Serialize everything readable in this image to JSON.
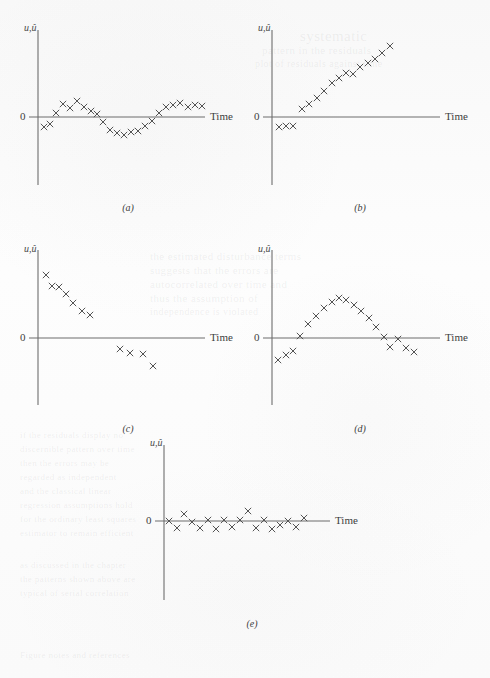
{
  "figure": {
    "background_color": "#fbfbfb",
    "axis_color": "#6d6d6d",
    "marker_color": "#545454",
    "marker_glyph": "x",
    "y_axis_label": "u,û",
    "x_axis_label": "Time",
    "zero_label": "0"
  },
  "ghost_text": [
    {
      "text": "systematic",
      "x": 300,
      "y": 28,
      "size": 15
    },
    {
      "text": "pattern in the residuals",
      "x": 262,
      "y": 44,
      "size": 11
    },
    {
      "text": "plot of residuals against time",
      "x": 255,
      "y": 58,
      "size": 10
    },
    {
      "text": "the estimated disturbance terms",
      "x": 150,
      "y": 250,
      "size": 11
    },
    {
      "text": "suggests that the errors are",
      "x": 150,
      "y": 264,
      "size": 11
    },
    {
      "text": "autocorrelated over time and",
      "x": 150,
      "y": 278,
      "size": 11
    },
    {
      "text": "thus the assumption of",
      "x": 150,
      "y": 292,
      "size": 11
    },
    {
      "text": "independence is violated",
      "x": 150,
      "y": 306,
      "size": 10
    },
    {
      "text": "if the residuals display no",
      "x": 20,
      "y": 430,
      "size": 9
    },
    {
      "text": "discernible pattern over time",
      "x": 20,
      "y": 444,
      "size": 9
    },
    {
      "text": "then the errors may be",
      "x": 20,
      "y": 458,
      "size": 9
    },
    {
      "text": "regarded as independent",
      "x": 20,
      "y": 472,
      "size": 9
    },
    {
      "text": "and the classical linear",
      "x": 20,
      "y": 486,
      "size": 9
    },
    {
      "text": "regression assumptions hold",
      "x": 20,
      "y": 500,
      "size": 9
    },
    {
      "text": "for the ordinary least squares",
      "x": 20,
      "y": 514,
      "size": 9
    },
    {
      "text": "estimator to remain efficient",
      "x": 20,
      "y": 528,
      "size": 9
    },
    {
      "text": "as discussed in the chapter",
      "x": 20,
      "y": 560,
      "size": 9
    },
    {
      "text": "the patterns shown above are",
      "x": 20,
      "y": 574,
      "size": 9
    },
    {
      "text": "typical of serial correlation",
      "x": 20,
      "y": 588,
      "size": 9
    },
    {
      "text": "Figure notes and references",
      "x": 20,
      "y": 650,
      "size": 9
    }
  ],
  "panels": [
    {
      "id": "a",
      "caption": "(a)",
      "origin": {
        "x": 38,
        "y": 117
      },
      "axis": {
        "y_top": 30,
        "y_bottom": 185,
        "x_right": 205
      },
      "label_positions": {
        "y_label_x": 24,
        "y_label_y": 22,
        "zero_x": 20,
        "zero_y": 110,
        "x_label_x": 210,
        "x_label_y": 110
      },
      "caption_position": {
        "x": 108,
        "y": 202
      },
      "chart_data": {
        "type": "scatter",
        "title": "(a)",
        "xlabel": "Time",
        "ylabel": "u,û",
        "description": "Residuals alternating around zero with no clear trend; cyclical/positive autocorrelation pattern",
        "x": [
          6,
          12,
          18,
          25,
          32,
          39,
          46,
          53,
          59,
          65,
          72,
          79,
          86,
          93,
          100,
          107,
          114,
          121,
          128,
          135,
          142,
          150,
          157,
          164
        ],
        "y": [
          -10,
          -7,
          4,
          13,
          9,
          16,
          10,
          6,
          3,
          -5,
          -13,
          -16,
          -18,
          -15,
          -14,
          -9,
          -4,
          4,
          10,
          12,
          14,
          10,
          12,
          11
        ]
      }
    },
    {
      "id": "b",
      "caption": "(b)",
      "origin": {
        "x": 272,
        "y": 117
      },
      "axis": {
        "y_top": 30,
        "y_bottom": 185,
        "x_right": 440
      },
      "label_positions": {
        "y_label_x": 258,
        "y_label_y": 22,
        "zero_x": 254,
        "zero_y": 110,
        "x_label_x": 445,
        "x_label_y": 110
      },
      "caption_position": {
        "x": 340,
        "y": 202
      },
      "chart_data": {
        "type": "scatter",
        "title": "(b)",
        "xlabel": "Time",
        "ylabel": "u,û",
        "description": "Residuals increasing steadily over time; strong positive trend indicating positive autocorrelation",
        "x": [
          7,
          14,
          21,
          30,
          37,
          45,
          52,
          60,
          67,
          74,
          81,
          88,
          96,
          103,
          110,
          118
        ],
        "y": [
          -10,
          -9,
          -9,
          8,
          13,
          19,
          26,
          34,
          39,
          44,
          43,
          50,
          54,
          58,
          64,
          71
        ]
      }
    },
    {
      "id": "c",
      "caption": "(c)",
      "origin": {
        "x": 38,
        "y": 338
      },
      "axis": {
        "y_top": 250,
        "y_bottom": 405,
        "x_right": 205
      },
      "label_positions": {
        "y_label_x": 24,
        "y_label_y": 243,
        "zero_x": 20,
        "zero_y": 331,
        "x_label_x": 210,
        "x_label_y": 331
      },
      "caption_position": {
        "x": 108,
        "y": 423
      },
      "chart_data": {
        "type": "scatter",
        "title": "(c)",
        "xlabel": "Time",
        "ylabel": "u,û",
        "description": "Residuals decreasing steadily over time; strong negative trend",
        "x": [
          8,
          14,
          21,
          28,
          35,
          44,
          52,
          82,
          92,
          105,
          115
        ],
        "y": [
          63,
          52,
          51,
          44,
          35,
          27,
          23,
          -11,
          -15,
          -16,
          -28
        ]
      }
    },
    {
      "id": "d",
      "caption": "(d)",
      "origin": {
        "x": 272,
        "y": 338
      },
      "axis": {
        "y_top": 250,
        "y_bottom": 405,
        "x_right": 440
      },
      "label_positions": {
        "y_label_x": 258,
        "y_label_y": 243,
        "zero_x": 254,
        "zero_y": 331,
        "x_label_x": 445,
        "x_label_y": 331
      },
      "caption_position": {
        "x": 340,
        "y": 423
      },
      "chart_data": {
        "type": "scatter",
        "title": "(d)",
        "xlabel": "Time",
        "ylabel": "u,û",
        "description": "Residuals follow an inverted-U (parabolic) pattern, rising then falling and crossing zero",
        "x": [
          6,
          14,
          21,
          28,
          36,
          44,
          52,
          60,
          67,
          74,
          82,
          89,
          97,
          104,
          112,
          118,
          126,
          134,
          142
        ],
        "y": [
          -22,
          -17,
          -13,
          2,
          14,
          22,
          30,
          36,
          40,
          38,
          33,
          27,
          20,
          11,
          1,
          -9,
          -1,
          -10,
          -14
        ]
      }
    },
    {
      "id": "e",
      "caption": "(e)",
      "origin": {
        "x": 164,
        "y": 521
      },
      "axis": {
        "y_top": 445,
        "y_bottom": 600,
        "x_right": 330
      },
      "label_positions": {
        "y_label_x": 150,
        "y_label_y": 437,
        "zero_x": 146,
        "zero_y": 514,
        "x_label_x": 335,
        "x_label_y": 514
      },
      "caption_position": {
        "x": 232,
        "y": 618
      },
      "chart_data": {
        "type": "scatter",
        "title": "(e)",
        "xlabel": "Time",
        "ylabel": "u,û",
        "description": "Residuals randomly scattered about zero with no discernible pattern; errors appear independent",
        "x": [
          5,
          13,
          20,
          28,
          36,
          44,
          52,
          60,
          68,
          76,
          84,
          92,
          100,
          108,
          116,
          124,
          132,
          140
        ],
        "y": [
          0,
          -7,
          7,
          -1,
          -7,
          1,
          -8,
          1,
          -6,
          1,
          10,
          -7,
          1,
          -8,
          -4,
          0,
          -6,
          3
        ]
      }
    }
  ]
}
